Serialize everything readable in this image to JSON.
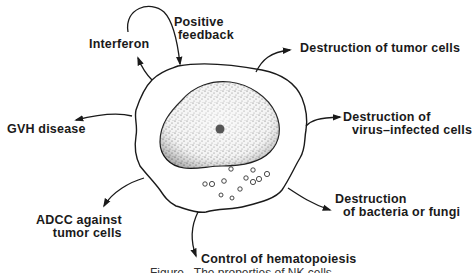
{
  "diagram": {
    "subject": "NK cell",
    "center": {
      "cell": "large granular lymphocyte",
      "nucleus": "kidney-shaped stippled nucleus",
      "granules": "cytoplasmic granules"
    },
    "labels": {
      "positive_feedback": [
        "Positive",
        "feedback"
      ],
      "interferon": "Interferon",
      "destruction_tumor": "Destruction of tumor cells",
      "destruction_virus": [
        "Destruction of",
        "virus–infected cells"
      ],
      "gvh": "GVH disease",
      "destruction_bacteria": [
        "Destruction",
        "of bacteria or fungi"
      ],
      "adcc": [
        "ADCC against",
        "tumor cells"
      ],
      "hematopoiesis": "Control of hematopoiesis"
    },
    "caption": "Figure . The properties of NK cells"
  }
}
